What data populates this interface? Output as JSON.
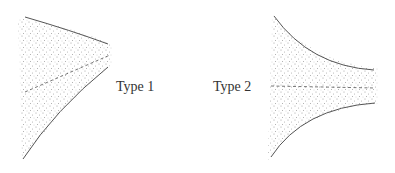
{
  "diagram": {
    "type1": {
      "label": "Type 1",
      "description": "converging stippled region, dashed centerline tilted upward"
    },
    "type2": {
      "label": "Type 2",
      "description": "converging stippled region, horizontal dashed centerline"
    },
    "colors": {
      "line": "#555555",
      "stipple": "#9a9a9a",
      "background": "#ffffff"
    }
  }
}
